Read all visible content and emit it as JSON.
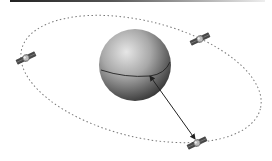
{
  "diagram": {
    "planet": {
      "cx": 135,
      "cy": 65,
      "r": 36
    },
    "orbit": {
      "cx": 141,
      "cy": 79,
      "rx": 123,
      "ry": 58,
      "rotate": 14
    },
    "satellites": [
      {
        "name": "satellite-left",
        "x": 26,
        "y": 58,
        "angle": -25
      },
      {
        "name": "satellite-upper-right",
        "x": 200,
        "y": 39,
        "angle": -25
      },
      {
        "name": "satellite-bottom",
        "x": 197,
        "y": 143,
        "angle": -25
      }
    ],
    "arrow": {
      "x1": 150,
      "y1": 76,
      "x2": 195,
      "y2": 139
    },
    "colors": {
      "sphere_light": "#d8d8d8",
      "sphere_dark": "#3a3a3a",
      "orbit": "#777777",
      "arrow": "#222222"
    }
  }
}
